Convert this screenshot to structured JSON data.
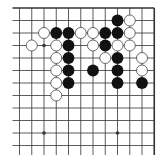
{
  "board": {
    "description": "Go board fragment (top-right corner) with stones",
    "colors": {
      "background": "#ffffff",
      "line": "#333333",
      "black_stone": "#111111",
      "white_stone": "#ffffff",
      "white_outline": "#444444"
    },
    "grid": {
      "columns": 12,
      "rows": 12,
      "origin_x": 19.5,
      "origin_y": 8,
      "spacing_x": 12.25,
      "spacing_y": 12.5,
      "edges": [
        "top",
        "right"
      ]
    },
    "star_points": [
      {
        "col": 2,
        "row": 3
      },
      {
        "col": 2,
        "row": 10
      },
      {
        "col": 8,
        "row": 10
      }
    ],
    "stones": [
      {
        "color": "black",
        "col": 8,
        "row": 1
      },
      {
        "color": "white",
        "col": 9,
        "row": 1
      },
      {
        "color": "white",
        "col": 2,
        "row": 2
      },
      {
        "color": "black",
        "col": 3,
        "row": 2
      },
      {
        "color": "black",
        "col": 4,
        "row": 2
      },
      {
        "color": "white",
        "col": 5,
        "row": 2
      },
      {
        "color": "white",
        "col": 6,
        "row": 2
      },
      {
        "color": "black",
        "col": 7,
        "row": 2
      },
      {
        "color": "black",
        "col": 8,
        "row": 2
      },
      {
        "color": "white",
        "col": 9,
        "row": 2
      },
      {
        "color": "white",
        "col": 1,
        "row": 3
      },
      {
        "color": "white",
        "col": 3,
        "row": 3
      },
      {
        "color": "black",
        "col": 4,
        "row": 3
      },
      {
        "color": "white",
        "col": 6,
        "row": 3
      },
      {
        "color": "black",
        "col": 7,
        "row": 3
      },
      {
        "color": "white",
        "col": 8,
        "row": 3
      },
      {
        "color": "white",
        "col": 9,
        "row": 3
      },
      {
        "color": "white",
        "col": 3,
        "row": 4
      },
      {
        "color": "black",
        "col": 4,
        "row": 4
      },
      {
        "color": "white",
        "col": 7,
        "row": 4
      },
      {
        "color": "black",
        "col": 8,
        "row": 4
      },
      {
        "color": "white",
        "col": 10,
        "row": 4
      },
      {
        "color": "white",
        "col": 3,
        "row": 5
      },
      {
        "color": "black",
        "col": 4,
        "row": 5
      },
      {
        "color": "black",
        "col": 6,
        "row": 5
      },
      {
        "color": "black",
        "col": 8,
        "row": 5
      },
      {
        "color": "white",
        "col": 10,
        "row": 5
      },
      {
        "color": "white",
        "col": 3,
        "row": 6
      },
      {
        "color": "black",
        "col": 4,
        "row": 6
      },
      {
        "color": "black",
        "col": 8,
        "row": 6
      },
      {
        "color": "black",
        "col": 10,
        "row": 6
      },
      {
        "color": "white",
        "col": 3,
        "row": 7
      }
    ]
  }
}
